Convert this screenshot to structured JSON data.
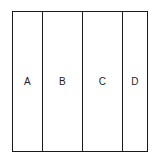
{
  "figure": {
    "type": "partitioned-rectangle-diagram",
    "background_color": "#ffffff",
    "outline_color": "#1a1a1a",
    "label_color": "#1d1d1d",
    "segments": [
      {
        "label": "A",
        "width_px": 30
      },
      {
        "label": "B",
        "width_px": 40
      },
      {
        "label": "C",
        "width_px": 40
      },
      {
        "label": "D",
        "width_px": 26
      }
    ]
  }
}
